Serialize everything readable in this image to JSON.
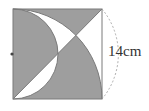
{
  "figure": {
    "type": "geometry-shaded-region",
    "side_label": "14cm",
    "colors": {
      "shade": "#9e9e9e",
      "stroke": "#777777",
      "background": "#ffffff",
      "dashed_arc": "#999999"
    },
    "elements": [
      "square",
      "diagonal",
      "quarter-circle-arc",
      "semicircle",
      "dashed-dimension-arc",
      "midpoint-dot"
    ]
  }
}
